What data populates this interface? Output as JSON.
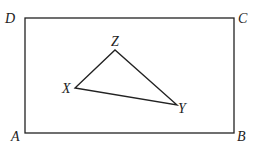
{
  "diagram": {
    "rectangle": {
      "labels": {
        "A": "A",
        "B": "B",
        "C": "C",
        "D": "D"
      },
      "points": {
        "A": [
          25,
          133
        ],
        "B": [
          234,
          133
        ],
        "C": [
          234,
          18
        ],
        "D": [
          25,
          18
        ]
      }
    },
    "triangle": {
      "labels": {
        "X": "X",
        "Y": "Y",
        "Z": "Z"
      },
      "points": {
        "X": [
          75,
          88
        ],
        "Y": [
          177,
          105
        ],
        "Z": [
          115,
          50
        ]
      }
    },
    "stroke_color": "#222222"
  }
}
